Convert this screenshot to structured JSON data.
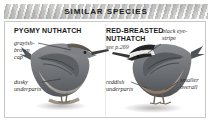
{
  "panel": {
    "header_title": "SIMILAR SPECIES",
    "accent_color": "#c9c9c6",
    "border_color": "#c8c8c4"
  },
  "species": [
    {
      "name": "PYGMY NUTHATCH",
      "reference": "",
      "annotations": [
        {
          "label": "grayish-\nbrown\ncap"
        },
        {
          "label": "dusky\nunderparts"
        }
      ]
    },
    {
      "name": "RED-BREASTED\nNUTHATCH",
      "reference": "see p.269",
      "annotations": [
        {
          "label": "black eye-\nstripe"
        },
        {
          "label": "reddish\nunderparts"
        },
        {
          "label": "smaller\noverall"
        }
      ]
    }
  ]
}
